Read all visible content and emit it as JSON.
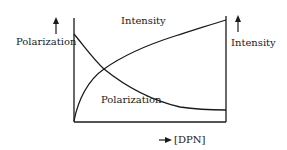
{
  "diagram": {
    "type": "line",
    "left_axis_label": "Polarization",
    "right_axis_label": "Intensity",
    "x_axis_label": "[DPN]",
    "curves": [
      {
        "name": "Intensity",
        "label": "Intensity",
        "trend": "increasing"
      },
      {
        "name": "Polarization",
        "label": "Polarization",
        "trend": "decreasing"
      }
    ],
    "colors": {
      "line": "#1a1a1a",
      "background": "#ffffff"
    }
  }
}
